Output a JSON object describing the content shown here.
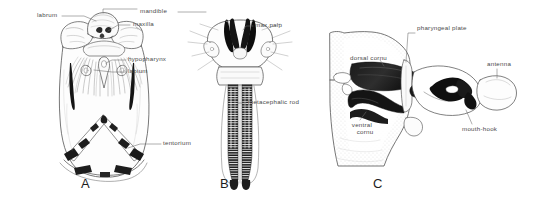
{
  "figure": {
    "background_color": "#ffffff",
    "ink_color": "#2b2b2b",
    "label_color": "#4a4a4a",
    "title": "",
    "panels": [
      {
        "letter": "A",
        "name": "ventral-head-capsule",
        "labels": [
          {
            "key": "labrum",
            "text": "labrum",
            "x": 37,
            "y": 14
          },
          {
            "key": "mandible",
            "text": "mandible",
            "x": 140,
            "y": 10
          },
          {
            "key": "maxilla",
            "text": "maxilla",
            "x": 133,
            "y": 23
          },
          {
            "key": "hypopharynx",
            "text": "hypopharynx",
            "x": 128,
            "y": 58
          },
          {
            "key": "labium",
            "text": "labium",
            "x": 128,
            "y": 70
          },
          {
            "key": "tentorium",
            "text": "tentorium",
            "x": 163,
            "y": 142
          }
        ]
      },
      {
        "letter": "B",
        "name": "dorsal-head-skeleton",
        "labels": [
          {
            "key": "max-palp",
            "text": "max.palp",
            "x": 255,
            "y": 24
          },
          {
            "key": "metacephalic-rod",
            "text": "metacephalic  rod",
            "x": 248,
            "y": 101
          }
        ]
      },
      {
        "letter": "C",
        "name": "lateral-cephalopharyngeal-skeleton",
        "labels": [
          {
            "key": "pharyngeal-plate",
            "text": "pharyngeal plate",
            "x": 417,
            "y": 27
          },
          {
            "key": "dorsal-cornu",
            "text": "dorsal cornu",
            "x": 350,
            "y": 57
          },
          {
            "key": "antenna",
            "text": "antenna",
            "x": 487,
            "y": 63
          },
          {
            "key": "ventral-cornu-1",
            "text": "ventral",
            "x": 347,
            "y": 124
          },
          {
            "key": "ventral-cornu-2",
            "text": "cornu",
            "x": 352,
            "y": 131
          },
          {
            "key": "mouth-hook",
            "text": "mouth-hook",
            "x": 462,
            "y": 128
          }
        ]
      }
    ],
    "panel_letters": [
      {
        "text": "A",
        "x": 81,
        "y": 184
      },
      {
        "text": "B",
        "x": 220,
        "y": 184
      },
      {
        "text": "C",
        "x": 373,
        "y": 184
      }
    ]
  }
}
